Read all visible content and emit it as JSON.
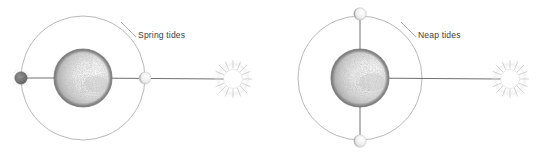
{
  "figure": {
    "title": "",
    "background_color": "#ffffff",
    "width": 540,
    "height": 154,
    "type": "astronomy-tide-alignment-diagram"
  },
  "palette": {
    "orbit_stroke": "#9a9a9a",
    "axis_line": "#555555",
    "earth_rim": "#8d8d8d",
    "earth_dark": "#7e7e7e",
    "earth_light": "#f2f2f2",
    "moon_dark": "#6f6f6f",
    "moon_light": "#e9e9e9",
    "sun_fill": "#ffffff",
    "sun_ray": "#cfcfcf",
    "label_text": "#3d3d3d",
    "leader_line": "#8e8e8e"
  },
  "panels": [
    {
      "id": "spring-tides",
      "label": "Spring tides",
      "label_x": 138,
      "label_y": 38,
      "leader": {
        "x1": 121,
        "y1": 22,
        "x2": 136,
        "y2": 37
      },
      "orbit": {
        "cx": 83,
        "cy": 78,
        "r": 62
      },
      "earth": {
        "cx": 83,
        "cy": 78,
        "r": 29
      },
      "sun": {
        "cx": 233,
        "cy": 79,
        "r": 9.5,
        "rays": 22
      },
      "sun_line": {
        "x1": 83,
        "y1": 78,
        "x2": 224,
        "y2": 79
      },
      "moons": [
        {
          "name": "moon-new-left",
          "cx": 21,
          "cy": 78,
          "r": 6.2,
          "phase": "dark",
          "position": "left-opposition"
        },
        {
          "name": "moon-full-right",
          "cx": 145,
          "cy": 78,
          "r": 6.0,
          "phase": "light",
          "position": "right-conjunction"
        }
      ],
      "alignment": "syzygy",
      "description": "Sun, Earth and Moon in line — spring tides"
    },
    {
      "id": "neap-tides",
      "label": "Neap tides",
      "label_x": 418,
      "label_y": 38,
      "leader": {
        "x1": 401,
        "y1": 22,
        "x2": 416,
        "y2": 37
      },
      "orbit": {
        "cx": 360,
        "cy": 78,
        "r": 62
      },
      "earth": {
        "cx": 360,
        "cy": 78,
        "r": 29
      },
      "sun": {
        "cx": 510,
        "cy": 79,
        "r": 9.5,
        "rays": 22
      },
      "sun_line": {
        "x1": 360,
        "y1": 78,
        "x2": 501,
        "y2": 79
      },
      "moons": [
        {
          "name": "moon-quarter-top",
          "cx": 360,
          "cy": 14,
          "r": 6.2,
          "phase": "half",
          "position": "top-quadrature"
        },
        {
          "name": "moon-quarter-bottom",
          "cx": 360,
          "cy": 141,
          "r": 6.2,
          "phase": "half",
          "position": "bottom-quadrature"
        }
      ],
      "alignment": "quadrature",
      "description": "Moon at right angles to Sun–Earth line — neap tides"
    }
  ]
}
